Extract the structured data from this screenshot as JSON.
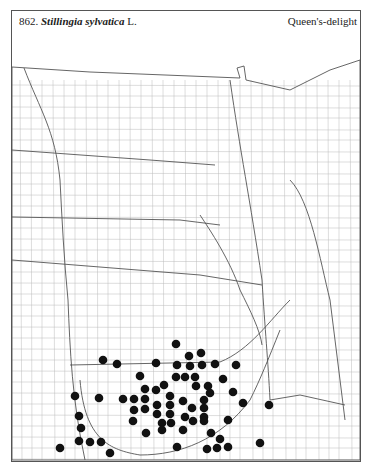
{
  "header": {
    "number": "862.",
    "genus_species": "Stillingia sylvatica",
    "author": "L.",
    "common_name": "Queen's-delight"
  },
  "map": {
    "type": "county dot distribution map",
    "region": "Great Plains",
    "dot_color": "#111111",
    "line_color": "#777777",
    "dots": [
      [
        176,
        344
      ],
      [
        189,
        356
      ],
      [
        201,
        353
      ],
      [
        103,
        360
      ],
      [
        117,
        364
      ],
      [
        156,
        363
      ],
      [
        177,
        365
      ],
      [
        190,
        366
      ],
      [
        202,
        365
      ],
      [
        215,
        364
      ],
      [
        236,
        365
      ],
      [
        140,
        376
      ],
      [
        176,
        377
      ],
      [
        185,
        377
      ],
      [
        195,
        377
      ],
      [
        223,
        379
      ],
      [
        196,
        386
      ],
      [
        208,
        386
      ],
      [
        164,
        385
      ],
      [
        145,
        389
      ],
      [
        156,
        390
      ],
      [
        210,
        393
      ],
      [
        233,
        392
      ],
      [
        75,
        396
      ],
      [
        99,
        398
      ],
      [
        123,
        399
      ],
      [
        134,
        399
      ],
      [
        145,
        399
      ],
      [
        170,
        396
      ],
      [
        183,
        401
      ],
      [
        204,
        400
      ],
      [
        243,
        403
      ],
      [
        157,
        405
      ],
      [
        170,
        405
      ],
      [
        192,
        408
      ],
      [
        204,
        408
      ],
      [
        134,
        410
      ],
      [
        145,
        409
      ],
      [
        157,
        414
      ],
      [
        170,
        414
      ],
      [
        79,
        416
      ],
      [
        185,
        417
      ],
      [
        204,
        417
      ],
      [
        133,
        421
      ],
      [
        162,
        423
      ],
      [
        171,
        423
      ],
      [
        193,
        421
      ],
      [
        204,
        421
      ],
      [
        228,
        420
      ],
      [
        81,
        428
      ],
      [
        162,
        430
      ],
      [
        183,
        430
      ],
      [
        146,
        433
      ],
      [
        211,
        433
      ],
      [
        220,
        439
      ],
      [
        79,
        441
      ],
      [
        90,
        442
      ],
      [
        101,
        442
      ],
      [
        60,
        448
      ],
      [
        177,
        447
      ],
      [
        207,
        449
      ],
      [
        217,
        448
      ],
      [
        228,
        447
      ],
      [
        110,
        453
      ],
      [
        269,
        405
      ],
      [
        260,
        443
      ]
    ]
  }
}
